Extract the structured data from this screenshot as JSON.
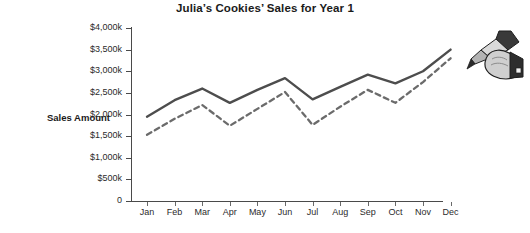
{
  "chart": {
    "title": "Julia’s Cookies’ Sales for Year 1",
    "y_axis_title": "Sales Amount"
  },
  "chart_data": {
    "type": "line",
    "title": "Julia’s Cookies’ Sales for Year 1",
    "xlabel": "",
    "ylabel": "Sales Amount",
    "categories": [
      "Jan",
      "Feb",
      "Mar",
      "Apr",
      "May",
      "Jun",
      "Jul",
      "Aug",
      "Sep",
      "Oct",
      "Nov",
      "Dec"
    ],
    "ytick_labels": [
      "$4,000k",
      "$3,500k",
      "$3,000k",
      "$2,500k",
      "$2,000k",
      "$1,500k",
      "$1,000k",
      "$500k",
      "0"
    ],
    "ytick_values": [
      4000,
      3500,
      3000,
      2500,
      2000,
      1500,
      1000,
      500,
      0
    ],
    "ylim": [
      0,
      4000
    ],
    "units": "thousands of dollars",
    "grid": false,
    "legend": "none",
    "series": [
      {
        "name": "Actual Sales",
        "style": "solid",
        "color": "#4d4d4d",
        "values": [
          1950,
          2330,
          2600,
          2270,
          2570,
          2840,
          2350,
          2640,
          2920,
          2720,
          3000,
          3500
        ]
      },
      {
        "name": "Projected Sales",
        "style": "dashed",
        "color": "#6b6b6b",
        "values": [
          1530,
          1900,
          2220,
          1740,
          2130,
          2520,
          1760,
          2180,
          2570,
          2270,
          2750,
          3300
        ]
      }
    ],
    "annotations": [
      {
        "name": "hand-drawing-pen",
        "description": "Illustration of a hand holding a pen drawing the dashed projected-sales line at the Dec end of the chart"
      }
    ]
  }
}
